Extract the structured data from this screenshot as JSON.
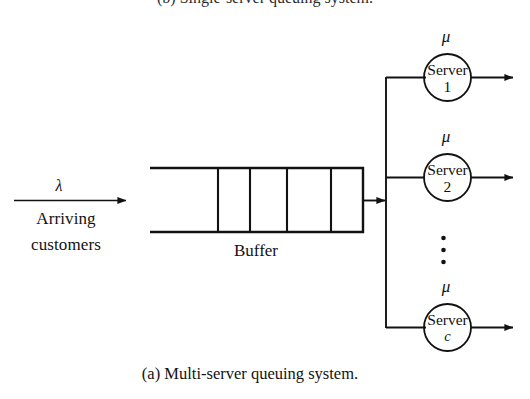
{
  "figure": {
    "caption": "(a) Multi-server queuing system.",
    "top_clipped_caption": "(b) Single-server queuing system.",
    "background_color": "#ffffff",
    "ink_color": "#121212",
    "type": "multi-server-queue-diagram"
  },
  "arrival": {
    "rate_symbol": "λ",
    "label_line1": "Arriving",
    "label_line2": "customers"
  },
  "buffer": {
    "label": "Buffer",
    "slot_count": 5,
    "divider_count": 4
  },
  "servers": [
    {
      "name": "Server",
      "index": "1",
      "rate_symbol": "μ",
      "index_italic": false
    },
    {
      "name": "Server",
      "index": "2",
      "rate_symbol": "μ",
      "index_italic": false
    },
    {
      "name": "Server",
      "index": "c",
      "rate_symbol": "μ",
      "index_italic": true
    }
  ],
  "ellipsis": {
    "symbol": "⋮",
    "dot_count": 3
  }
}
